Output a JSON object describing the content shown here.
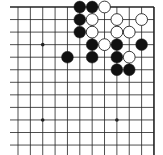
{
  "board": {
    "title": "Go board fragment (top-right corner)",
    "background": "#ffffff",
    "line_color": "#222222",
    "columns": 12,
    "rows": 12,
    "origin_x": 18,
    "origin_y": 7,
    "spacing_x": 12.36,
    "spacing_y": 12.55,
    "edges": {
      "top": true,
      "right": true,
      "left": false,
      "bottom": false
    },
    "star_points": [
      {
        "col": 2,
        "row": 3
      },
      {
        "col": 2,
        "row": 9
      },
      {
        "col": 8,
        "row": 9
      }
    ],
    "stones": [
      {
        "color": "black",
        "col": 5,
        "row": 0
      },
      {
        "color": "black",
        "col": 6,
        "row": 0
      },
      {
        "color": "white",
        "col": 7,
        "row": 0
      },
      {
        "color": "black",
        "col": 5,
        "row": 1
      },
      {
        "color": "white",
        "col": 6,
        "row": 1
      },
      {
        "color": "white",
        "col": 8,
        "row": 1
      },
      {
        "color": "white",
        "col": 10,
        "row": 1
      },
      {
        "color": "black",
        "col": 5,
        "row": 2
      },
      {
        "color": "white",
        "col": 6,
        "row": 2
      },
      {
        "color": "white",
        "col": 8,
        "row": 2
      },
      {
        "color": "white",
        "col": 9,
        "row": 2
      },
      {
        "color": "black",
        "col": 6,
        "row": 3
      },
      {
        "color": "white",
        "col": 7,
        "row": 3
      },
      {
        "color": "black",
        "col": 8,
        "row": 3
      },
      {
        "color": "black",
        "col": 10,
        "row": 3
      },
      {
        "color": "black",
        "col": 4,
        "row": 4
      },
      {
        "color": "black",
        "col": 6,
        "row": 4
      },
      {
        "color": "black",
        "col": 8,
        "row": 4
      },
      {
        "color": "white",
        "col": 9,
        "row": 4
      },
      {
        "color": "black",
        "col": 8,
        "row": 5
      },
      {
        "color": "black",
        "col": 9,
        "row": 5
      }
    ],
    "colors": {
      "black": "#111111",
      "white": "#ffffff",
      "stroke": "#222222"
    }
  }
}
